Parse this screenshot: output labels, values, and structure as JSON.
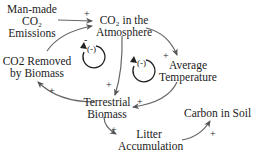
{
  "diagram": {
    "type": "causal-loop",
    "nodes": [
      {
        "id": "emissions",
        "lines": [
          "Man-made",
          "CO₂",
          "Emissions"
        ]
      },
      {
        "id": "co2_atm",
        "lines": [
          "CO₂ in the",
          "Atmosphere"
        ]
      },
      {
        "id": "temperature",
        "lines": [
          "Average",
          "Temperature"
        ]
      },
      {
        "id": "removed",
        "lines": [
          "CO2 Removed",
          "by Biomass"
        ]
      },
      {
        "id": "biomass",
        "lines": [
          "Terrestrial",
          "Biomass"
        ]
      },
      {
        "id": "litter",
        "lines": [
          "Litter",
          "Accumulation"
        ]
      },
      {
        "id": "soil",
        "lines": [
          "Carbon in Soil"
        ]
      }
    ],
    "edges": [
      {
        "from": "emissions",
        "to": "co2_atm",
        "sign": "+"
      },
      {
        "from": "removed",
        "to": "co2_atm",
        "sign": "-"
      },
      {
        "from": "co2_atm",
        "to": "temperature",
        "sign": "+"
      },
      {
        "from": "co2_atm",
        "to": "biomass",
        "sign": "+"
      },
      {
        "from": "temperature",
        "to": "biomass",
        "sign": "+"
      },
      {
        "from": "biomass",
        "to": "removed",
        "sign": "+"
      },
      {
        "from": "biomass",
        "to": "litter",
        "sign": "+"
      },
      {
        "from": "litter",
        "to": "soil",
        "sign": "+"
      }
    ],
    "loops": [
      {
        "id": "loop-left",
        "label": "(-)"
      },
      {
        "id": "loop-right",
        "label": "(-)"
      }
    ]
  },
  "signs": {
    "plus": "+",
    "minus": "-"
  }
}
